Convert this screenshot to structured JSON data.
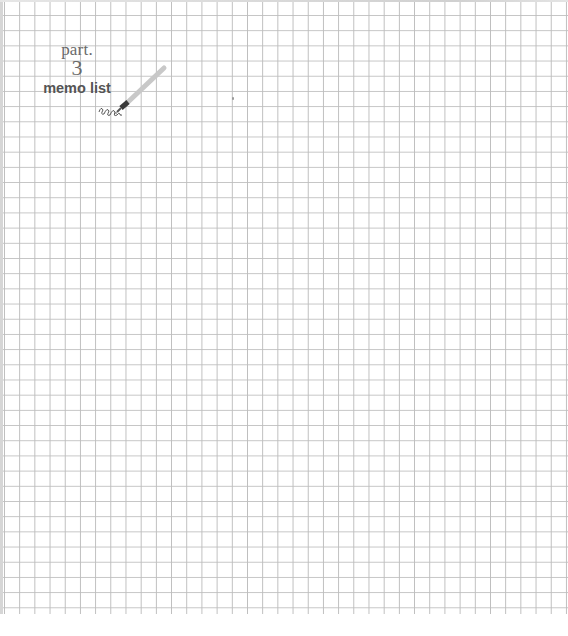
{
  "page": {
    "background": "#ffffff",
    "grid": {
      "cell_size_px": 15.2,
      "line_color": "#c0c0c0"
    }
  },
  "heading": {
    "part_label": "part.",
    "part_number": "3",
    "title": "memo list"
  },
  "decoration": {
    "icon": "pencil-icon",
    "scribble": "squiggle-icon"
  }
}
